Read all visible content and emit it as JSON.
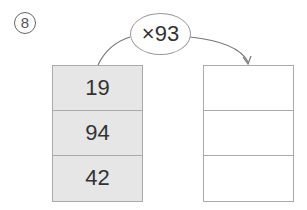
{
  "problem": {
    "number_label": "⑧",
    "operator": "×93",
    "inputs": [
      "19",
      "94",
      "42"
    ],
    "outputs": [
      "",
      "",
      ""
    ]
  }
}
